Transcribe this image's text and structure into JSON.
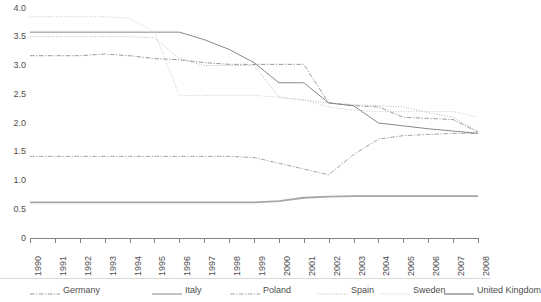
{
  "chart_data": {
    "type": "line",
    "title": "",
    "subtitle": "",
    "xlabel": "",
    "ylabel": "",
    "grid": false,
    "legend_position": "bottom",
    "xlim": [
      1990,
      2008
    ],
    "ylim": [
      0,
      4.0
    ],
    "categories": [
      "1990",
      "1991",
      "1992",
      "1993",
      "1994",
      "1995",
      "1996",
      "1997",
      "1998",
      "1999",
      "2000",
      "2001",
      "2002",
      "2003",
      "2004",
      "2005",
      "2006",
      "2007",
      "2008"
    ],
    "x": [
      1990,
      1991,
      1992,
      1993,
      1994,
      1995,
      1996,
      1997,
      1998,
      1999,
      2000,
      2001,
      2002,
      2003,
      2004,
      2005,
      2006,
      2007,
      2008
    ],
    "y_ticks": [
      "0",
      "0.5",
      "1.0",
      "1.5",
      "2.0",
      "2.5",
      "3.0",
      "3.5",
      "4.0"
    ],
    "y_tick_values": [
      0,
      0.5,
      1.0,
      1.5,
      2.0,
      2.5,
      3.0,
      3.5,
      4.0
    ],
    "series": [
      {
        "name": "Germany",
        "style": "dash-dot",
        "color": "#8c8c8c",
        "width": 0.9,
        "values": [
          3.17,
          3.17,
          3.17,
          3.2,
          3.17,
          3.12,
          3.1,
          3.05,
          3.02,
          3.02,
          3.02,
          3.02,
          2.35,
          2.3,
          2.28,
          2.1,
          2.08,
          2.06,
          1.84
        ]
      },
      {
        "name": "Italy",
        "style": "solid",
        "color": "#7a7a7a",
        "width": 0.9,
        "values": [
          3.58,
          3.58,
          3.58,
          3.58,
          3.58,
          3.58,
          3.58,
          3.45,
          3.28,
          3.05,
          2.7,
          2.7,
          2.35,
          2.3,
          2.0,
          1.95,
          1.9,
          1.86,
          1.82
        ]
      },
      {
        "name": "Poland",
        "style": "dash-dot",
        "color": "#999999",
        "width": 0.9,
        "values": [
          1.42,
          1.42,
          1.42,
          1.42,
          1.42,
          1.42,
          1.42,
          1.42,
          1.42,
          1.4,
          1.3,
          1.2,
          1.1,
          1.45,
          1.72,
          1.78,
          1.8,
          1.82,
          1.82
        ]
      },
      {
        "name": "Spain",
        "style": "dotted",
        "color": "#b0b0b0",
        "width": 0.9,
        "values": [
          3.5,
          3.5,
          3.5,
          3.5,
          3.5,
          3.48,
          3.12,
          3.0,
          3.0,
          3.0,
          2.45,
          2.4,
          2.35,
          2.32,
          2.3,
          2.28,
          2.18,
          2.1,
          1.85
        ]
      },
      {
        "name": "Sweden",
        "style": "dotted",
        "color": "#c4c4c4",
        "width": 0.9,
        "values": [
          3.85,
          3.85,
          3.85,
          3.85,
          3.82,
          3.58,
          2.48,
          2.48,
          2.48,
          2.48,
          2.45,
          2.4,
          2.28,
          2.22,
          2.2,
          2.2,
          2.2,
          2.2,
          2.1
        ]
      },
      {
        "name": "United Kingdom",
        "style": "solid",
        "color": "#a6a6a6",
        "width": 1.8,
        "values": [
          0.62,
          0.62,
          0.62,
          0.62,
          0.62,
          0.62,
          0.62,
          0.62,
          0.62,
          0.62,
          0.64,
          0.7,
          0.72,
          0.73,
          0.73,
          0.73,
          0.73,
          0.73,
          0.73
        ]
      }
    ],
    "legend": [
      {
        "label": "Germany",
        "style": "dash-dot",
        "color": "#8c8c8c",
        "width": 0.9
      },
      {
        "label": "Italy",
        "style": "solid",
        "color": "#7a7a7a",
        "width": 0.9
      },
      {
        "label": "Poland",
        "style": "dash-dot",
        "color": "#999999",
        "width": 0.9
      },
      {
        "label": "Spain",
        "style": "dotted",
        "color": "#b0b0b0",
        "width": 0.9
      },
      {
        "label": "Sweden",
        "style": "dotted",
        "color": "#c4c4c4",
        "width": 0.9
      },
      {
        "label": "United Kingdom",
        "style": "solid",
        "color": "#a6a6a6",
        "width": 1.8
      }
    ],
    "axis_color": "#808080"
  }
}
